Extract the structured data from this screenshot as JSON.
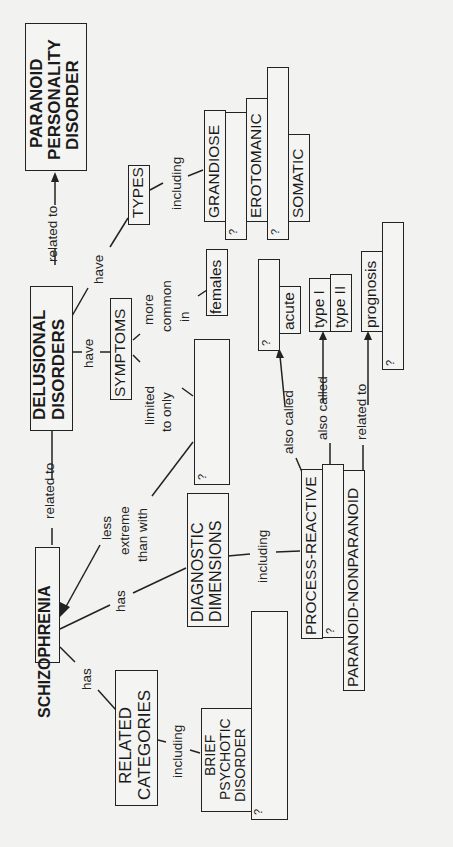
{
  "nodes": {
    "paranoid_personality": [
      "PARANOID",
      "PERSONALITY",
      "DISORDER"
    ],
    "delusional": [
      "DELUSIONAL",
      "DISORDERS"
    ],
    "schizophrenia": "SCHIZOPHRENIA",
    "types": "TYPES",
    "grandiose": "GRANDIOSE",
    "erotomanic": "EROTOMANIC",
    "somatic": "SOMATIC",
    "symptoms": "SYMPTOMS",
    "females": "females",
    "acute": "acute",
    "type1": "type I",
    "type2": "type II",
    "prognosis": "prognosis",
    "diagnostic": [
      "DIAGNOSTIC",
      "DIMENSIONS"
    ],
    "process_reactive": "PROCESS-REACTIVE",
    "paranoid_nonparanoid": "PARANOID-NONPARANOID",
    "related_categories": [
      "RELATED",
      "CATEGORIES"
    ],
    "brief_psychotic": [
      "BRIEF",
      "PSYCHOTIC",
      "DISORDER"
    ],
    "blank": "?"
  },
  "links": {
    "related_to": "related to",
    "have": "have",
    "including": "including",
    "more_common_in": [
      "more",
      "common",
      "in"
    ],
    "limited_to_only": [
      "limited",
      "to only"
    ],
    "less_extreme": [
      "less",
      "extreme",
      "than with"
    ],
    "has": "has",
    "also_called": "also called"
  }
}
